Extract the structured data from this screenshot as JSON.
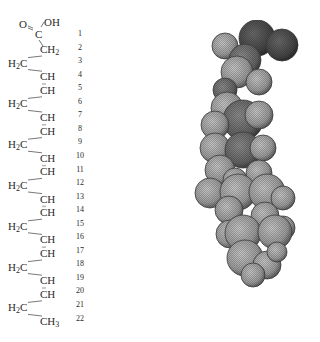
{
  "figure": {
    "structure": {
      "head": {
        "carbonyl_oxygen": "O",
        "hydroxyl": "OH",
        "carbon": "C"
      },
      "chain": [
        {
          "left": "",
          "main": "CH",
          "sub": "2",
          "side": "right"
        },
        {
          "left": "H",
          "sub_left": "2",
          "main": "C",
          "side": "left"
        },
        {
          "main": "CH",
          "side": "right"
        },
        {
          "main": "CH",
          "side": "right"
        },
        {
          "left": "H",
          "sub_left": "2",
          "main": "C",
          "side": "left"
        },
        {
          "main": "CH",
          "side": "right"
        },
        {
          "main": "CH",
          "side": "right"
        },
        {
          "left": "H",
          "sub_left": "2",
          "main": "C",
          "side": "left"
        },
        {
          "main": "CH",
          "side": "right"
        },
        {
          "main": "CH",
          "side": "right"
        },
        {
          "left": "H",
          "sub_left": "2",
          "main": "C",
          "side": "left"
        },
        {
          "main": "CH",
          "side": "right"
        },
        {
          "main": "CH",
          "side": "right"
        },
        {
          "left": "H",
          "sub_left": "2",
          "main": "C",
          "side": "left"
        },
        {
          "main": "CH",
          "side": "right"
        },
        {
          "main": "CH",
          "side": "right"
        },
        {
          "left": "H",
          "sub_left": "2",
          "main": "C",
          "side": "left"
        },
        {
          "main": "CH",
          "side": "right"
        },
        {
          "main": "CH",
          "side": "right"
        },
        {
          "left": "H",
          "sub_left": "2",
          "main": "C",
          "side": "left"
        },
        {
          "main": "CH",
          "sub": "3",
          "side": "right"
        }
      ],
      "carbon_numbers": [
        "1",
        "2",
        "3",
        "4",
        "5",
        "6",
        "7",
        "8",
        "9",
        "10",
        "11",
        "12",
        "13",
        "14",
        "15",
        "16",
        "17",
        "18",
        "19",
        "20",
        "21",
        "22"
      ]
    },
    "model": {
      "type": "space-filling molecular model",
      "colors": {
        "oxygen": "#4a4a4a",
        "carbon": "#6e6e6e",
        "hydrogen": "#a8a8a8",
        "outline": "#3c3c3c"
      }
    }
  }
}
